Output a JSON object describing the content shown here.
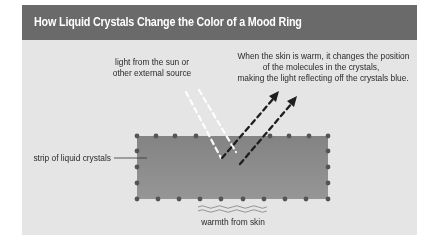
{
  "header": {
    "title": "How Liquid Crystals Change the Color of a Mood Ring"
  },
  "labels": {
    "light_source": [
      "light from the sun or",
      "other external source"
    ],
    "explanation": [
      "When the skin is warm, it changes the position",
      "of the molecules in the crystals,",
      "making the light reflecting off the crystals blue."
    ],
    "strip": "strip of liquid crystals",
    "warmth": "warmth from skin"
  },
  "colors": {
    "header_bg": "#6a6a6a",
    "panel_bg": "#e5e5e5",
    "strip_fill": "#8c8c8c",
    "dot": "#555555",
    "incoming_light": "#ffffff",
    "reflected_light": "#1e1e1e"
  }
}
